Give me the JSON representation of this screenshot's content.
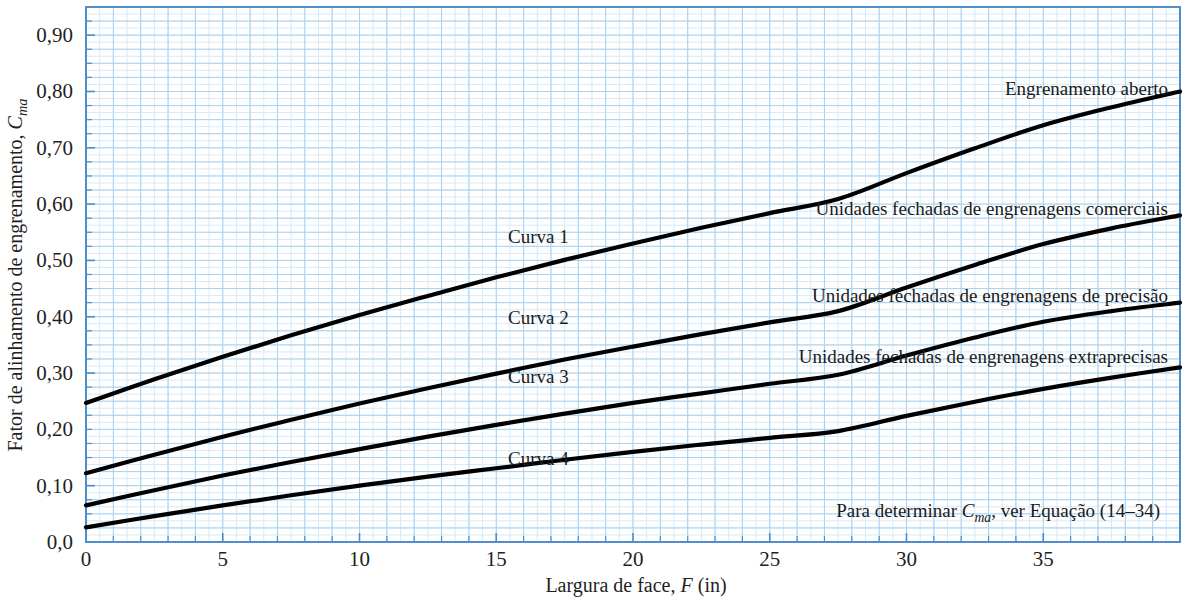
{
  "chart_data": {
    "type": "line",
    "title": "",
    "xlabel": "Largura de face, F (in)",
    "ylabel": "Fator de alinhamento de engrenamento, C_ma",
    "xlim": [
      0,
      40
    ],
    "ylim": [
      0.0,
      0.95
    ],
    "grid": true,
    "legend_position": "inline-annotations",
    "xticks": [
      0,
      5,
      10,
      15,
      20,
      25,
      30,
      35
    ],
    "xtick_labels": [
      "0",
      "5",
      "10",
      "15",
      "20",
      "25",
      "30",
      "35"
    ],
    "yticks": [
      0.0,
      0.1,
      0.2,
      0.3,
      0.4,
      0.5,
      0.6,
      0.7,
      0.8,
      0.9
    ],
    "ytick_labels": [
      "0,0",
      "0,10",
      "0,20",
      "0,30",
      "0,40",
      "0,50",
      "0,60",
      "0,70",
      "0,80",
      "0,90"
    ],
    "x": [
      0,
      2.5,
      5,
      7.5,
      10,
      12.5,
      15,
      17.5,
      20,
      22.5,
      25,
      27.5,
      30,
      32.5,
      35,
      37.5,
      40
    ],
    "series": [
      {
        "name": "Curva 1",
        "annotation": "Engrenamento aberto",
        "values": [
          0.247,
          0.289,
          0.329,
          0.367,
          0.403,
          0.437,
          0.47,
          0.501,
          0.53,
          0.558,
          0.584,
          0.609,
          0.655,
          0.699,
          0.74,
          0.772,
          0.8
        ]
      },
      {
        "name": "Curva 2",
        "annotation": "Unidades fechadas de engrenagens comerciais",
        "values": [
          0.122,
          0.155,
          0.187,
          0.217,
          0.246,
          0.273,
          0.299,
          0.324,
          0.347,
          0.369,
          0.39,
          0.41,
          0.452,
          0.492,
          0.529,
          0.557,
          0.58
        ]
      },
      {
        "name": "Curva 3",
        "annotation": "Unidades fechadas de engrenagens de precisão",
        "values": [
          0.065,
          0.092,
          0.118,
          0.142,
          0.165,
          0.187,
          0.208,
          0.228,
          0.247,
          0.264,
          0.281,
          0.297,
          0.331,
          0.363,
          0.391,
          0.41,
          0.425
        ]
      },
      {
        "name": "Curva 4",
        "annotation": "Unidades fechadas de engrenagens extraprecisas",
        "values": [
          0.026,
          0.046,
          0.065,
          0.083,
          0.1,
          0.116,
          0.131,
          0.146,
          0.16,
          0.173,
          0.185,
          0.197,
          0.224,
          0.249,
          0.272,
          0.292,
          0.31
        ]
      }
    ],
    "annotations": {
      "note": "Para determinar C_ma, ver Equação (14–34)",
      "note_parts": {
        "before": "Para determinar ",
        "symbol_base": "C",
        "symbol_sub": "ma",
        "after": ", ver Equação (14–34)"
      },
      "ylabel_parts": {
        "text": "Fator de alinhamento de engrenamento, ",
        "symbol_base": "C",
        "symbol_sub": "ma"
      },
      "xlabel_parts": {
        "before": "Largura de face, ",
        "symbol": "F",
        "after": " (in)"
      }
    },
    "curve_labels": [
      "Curva 1",
      "Curva 2",
      "Curva 3",
      "Curva 4"
    ],
    "right_labels": [
      "Engrenamento aberto",
      "Unidades fechadas de engrenagens comerciais",
      "Unidades fechadas de engrenagens de precisão",
      "Unidades fechadas de engrenagens extraprecisas"
    ],
    "colors": {
      "curve": "#000000",
      "axis": "#4d8fcc",
      "grid_major": "#a9d2ef",
      "grid_minor": "#d6eaf8",
      "background": "#ffffff",
      "text": "#1a1a1a"
    }
  }
}
